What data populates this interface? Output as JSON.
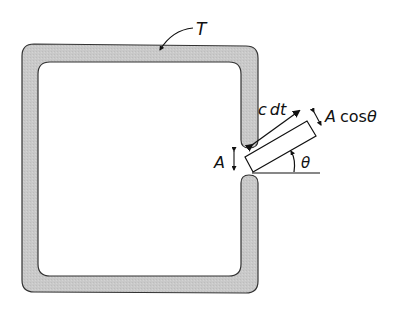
{
  "diagram": {
    "labels": {
      "temperature": "T",
      "length": "c dt",
      "length_c": "c",
      "length_dt": "dt",
      "projected_area": "A cos",
      "projected_area_theta": "θ",
      "hole_area": "A",
      "angle": "θ"
    },
    "colors": {
      "wall_fill": "#c8c8c8",
      "wall_stroke": "#333333",
      "line": "#111111",
      "background": "#ffffff"
    },
    "geometry": {
      "angle_degrees": 30,
      "wall_thickness_px": 17
    }
  }
}
